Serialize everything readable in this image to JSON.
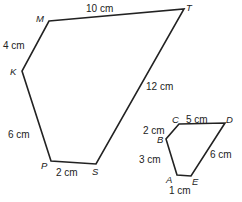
{
  "figure": {
    "shape1": {
      "name": "MTSPK",
      "vertices": {
        "M": "M",
        "T": "T",
        "S": "S",
        "P": "P",
        "K": "K"
      },
      "sides": {
        "MT": "10 cm",
        "MK": "4 cm",
        "KP": "6 cm",
        "PS": "2 cm",
        "TS": "12 cm"
      }
    },
    "shape2": {
      "name": "CDEAB",
      "vertices": {
        "C": "C",
        "D": "D",
        "E": "E",
        "A": "A",
        "B": "B"
      },
      "sides": {
        "CD": "5 cm",
        "BC": "2 cm",
        "AB": "3 cm",
        "AE": "1 cm",
        "DE": "6 cm"
      }
    },
    "stroke_color": "#222222"
  }
}
